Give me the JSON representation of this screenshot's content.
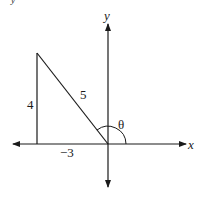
{
  "diagram": {
    "type": "reference-triangle",
    "axes": {
      "x_label": "x",
      "y_label": "y"
    },
    "triangle": {
      "vertical_side_label": "4",
      "hypotenuse_label": "5",
      "base_label": "−3"
    },
    "angle_label": "θ",
    "top_fragment": "y"
  }
}
